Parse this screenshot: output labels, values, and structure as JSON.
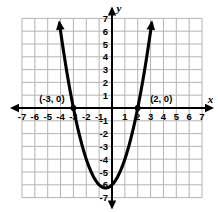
{
  "figure": {
    "kind": "coordinate-grid-graph",
    "background": "#ffffff",
    "grid_color": "#b4b4b4",
    "axis_color": "#000000",
    "curve_color": "#000000"
  },
  "axes": {
    "x_label": "x",
    "y_label": "y",
    "x_ticks": [
      "-7",
      "-6",
      "-5",
      "-4",
      "-3",
      "-2",
      "-1",
      "1",
      "2",
      "3",
      "4",
      "5",
      "6",
      "7"
    ],
    "y_ticks": [
      "7",
      "6",
      "5",
      "4",
      "3",
      "2",
      "1",
      "-1",
      "-2",
      "-3",
      "-4",
      "-5",
      "-6",
      "-7"
    ],
    "x_range": [
      -7,
      7
    ],
    "y_range": [
      -7,
      7
    ],
    "grid": true,
    "origin_label_hidden": true
  },
  "annotations": [
    {
      "text": "(-3, 0)",
      "x": -3,
      "y": 0,
      "name": "left-intercept-label"
    },
    {
      "text": "(2, 0)",
      "x": 2,
      "y": 0,
      "name": "right-intercept-label"
    }
  ],
  "chart_data": {
    "type": "line",
    "title": "",
    "xlabel": "x",
    "ylabel": "y",
    "xlim": [
      -7,
      7
    ],
    "ylim": [
      -7,
      7
    ],
    "grid": true,
    "legend": "none",
    "series": [
      {
        "name": "parabola",
        "equation": "y = x^2 + x - 6",
        "roots": [
          -3,
          2
        ],
        "vertex": [
          -0.5,
          -6.25
        ],
        "x": [
          -3.45,
          -3.2,
          -3,
          -2.75,
          -2.5,
          -2.25,
          -2,
          -1.75,
          -1.5,
          -1.25,
          -1,
          -0.75,
          -0.5,
          -0.25,
          0,
          0.25,
          0.5,
          0.75,
          1,
          1.25,
          1.5,
          1.75,
          2,
          2.25,
          2.45
        ],
        "y": [
          6.05,
          2.04,
          0,
          -1.19,
          -2.25,
          -3.19,
          -4,
          -4.69,
          -5.25,
          -5.69,
          -6,
          -6.19,
          -6.25,
          -6.19,
          -6,
          -5.69,
          -5.25,
          -4.69,
          -4,
          -3.19,
          -2.25,
          -1.19,
          0,
          1.31,
          2.45
        ]
      }
    ],
    "markers": [
      {
        "x": -3,
        "y": 0,
        "label": "(-3, 0)"
      },
      {
        "x": 2,
        "y": 0,
        "label": "(2, 0)"
      }
    ],
    "arrow_ends": [
      "up-left-branch",
      "up-right-branch"
    ]
  }
}
